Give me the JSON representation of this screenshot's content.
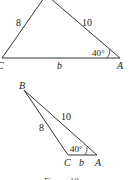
{
  "figure": {
    "triangle1": {
      "vertices": {
        "C": "C",
        "A": "A"
      },
      "side_CB": "8",
      "side_BA": "10",
      "side_CA": "b",
      "angle_A": "40°"
    },
    "triangle2": {
      "vertices": {
        "B": "B",
        "C": "C",
        "A": "A"
      },
      "side_BC": "8",
      "side_BA": "10",
      "side_CA": "b",
      "angle_A": "40°"
    },
    "caption": "Figure 10"
  }
}
